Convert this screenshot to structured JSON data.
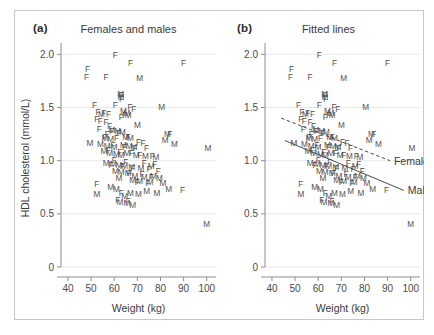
{
  "figure": {
    "panels": [
      {
        "letter": "(a)",
        "title": "Females and males"
      },
      {
        "letter": "(b)",
        "title": "Fitted lines"
      }
    ]
  },
  "chart_data": {
    "type": "scatter",
    "xlabel": "Weight (kg)",
    "ylabel": "HDL cholesterol (mmol/L)",
    "xlim": [
      37,
      104
    ],
    "ylim": [
      0,
      2.05
    ],
    "xticks": [
      40,
      50,
      60,
      70,
      80,
      90,
      100
    ],
    "xticklabels": [
      "40",
      "50",
      "60",
      "70",
      "80",
      "90",
      "100"
    ],
    "yticks": [
      0,
      0.5,
      1.0,
      1.5,
      2.0
    ],
    "yticklabels": [
      "0",
      "0.5",
      "1.0",
      "1.5",
      "2.0"
    ],
    "grid": "horizontal",
    "legend_position": "inline-line-labels",
    "marker_encoding": {
      "F": "female",
      "M": "male"
    },
    "series": [
      {
        "name": "Female",
        "marker": "F",
        "points": [
          [
            60.5,
            1.99
          ],
          [
            67.0,
            1.92
          ],
          [
            90.0,
            1.92
          ],
          [
            48.5,
            1.86
          ],
          [
            48.0,
            1.79
          ],
          [
            56.5,
            1.79
          ],
          [
            63.0,
            1.62
          ],
          [
            63.2,
            1.58
          ],
          [
            51.5,
            1.52
          ],
          [
            60.5,
            1.52
          ],
          [
            66.8,
            1.5
          ],
          [
            68.5,
            1.49
          ],
          [
            53.0,
            1.46
          ],
          [
            55.5,
            1.45
          ],
          [
            57.5,
            1.44
          ],
          [
            64.5,
            1.43
          ],
          [
            63.0,
            1.41
          ],
          [
            52.5,
            1.39
          ],
          [
            54.0,
            1.37
          ],
          [
            56.5,
            1.36
          ],
          [
            58.0,
            1.33
          ],
          [
            53.5,
            1.3
          ],
          [
            59.0,
            1.28
          ],
          [
            57.0,
            1.25
          ],
          [
            62.0,
            1.26
          ],
          [
            84.0,
            1.25
          ],
          [
            56.0,
            1.22
          ],
          [
            61.0,
            1.21
          ],
          [
            66.0,
            1.22
          ],
          [
            70.5,
            1.18
          ],
          [
            72.5,
            1.17
          ],
          [
            59.5,
            1.15
          ],
          [
            64.5,
            1.13
          ],
          [
            69.0,
            1.12
          ],
          [
            74.0,
            1.12
          ],
          [
            57.5,
            1.1
          ],
          [
            62.5,
            1.08
          ],
          [
            67.5,
            1.07
          ],
          [
            71.0,
            1.05
          ],
          [
            76.5,
            1.04
          ],
          [
            60.0,
            1.01
          ],
          [
            65.0,
            0.99
          ],
          [
            73.0,
            0.98
          ],
          [
            77.5,
            0.97
          ],
          [
            58.5,
            0.96
          ],
          [
            63.5,
            0.95
          ],
          [
            68.0,
            0.93
          ],
          [
            75.0,
            0.92
          ],
          [
            79.0,
            0.9
          ],
          [
            66.5,
            0.88
          ],
          [
            72.0,
            0.87
          ],
          [
            76.0,
            0.85
          ],
          [
            52.5,
            0.78
          ],
          [
            70.0,
            0.8
          ],
          [
            74.5,
            0.79
          ],
          [
            63.0,
            0.7
          ],
          [
            89.5,
            0.72
          ],
          [
            61.5,
            0.63
          ],
          [
            66.0,
            0.62
          ]
        ]
      },
      {
        "name": "Male",
        "marker": "M",
        "points": [
          [
            71.0,
            1.78
          ],
          [
            80.5,
            1.5
          ],
          [
            62.8,
            1.63
          ],
          [
            62.9,
            1.6
          ],
          [
            64.0,
            1.47
          ],
          [
            65.5,
            1.45
          ],
          [
            54.5,
            1.44
          ],
          [
            66.0,
            1.43
          ],
          [
            70.0,
            1.34
          ],
          [
            59.0,
            1.29
          ],
          [
            61.5,
            1.28
          ],
          [
            63.5,
            1.27
          ],
          [
            83.0,
            1.25
          ],
          [
            49.5,
            1.17
          ],
          [
            56.0,
            1.21
          ],
          [
            58.5,
            1.2
          ],
          [
            65.0,
            1.22
          ],
          [
            67.0,
            1.21
          ],
          [
            82.0,
            1.19
          ],
          [
            86.0,
            1.16
          ],
          [
            54.0,
            1.16
          ],
          [
            57.0,
            1.14
          ],
          [
            60.0,
            1.13
          ],
          [
            64.0,
            1.15
          ],
          [
            66.5,
            1.14
          ],
          [
            68.5,
            1.13
          ],
          [
            100.5,
            1.12
          ],
          [
            55.5,
            1.09
          ],
          [
            58.0,
            1.07
          ],
          [
            61.0,
            1.06
          ],
          [
            63.0,
            1.05
          ],
          [
            65.5,
            1.07
          ],
          [
            69.5,
            1.05
          ],
          [
            73.5,
            1.04
          ],
          [
            78.0,
            1.03
          ],
          [
            56.5,
            0.98
          ],
          [
            59.5,
            0.97
          ],
          [
            62.0,
            0.96
          ],
          [
            64.5,
            0.95
          ],
          [
            67.5,
            0.94
          ],
          [
            71.5,
            0.93
          ],
          [
            76.0,
            0.95
          ],
          [
            60.5,
            0.9
          ],
          [
            63.0,
            0.89
          ],
          [
            66.0,
            0.88
          ],
          [
            69.0,
            0.86
          ],
          [
            73.0,
            0.85
          ],
          [
            77.0,
            0.86
          ],
          [
            79.5,
            0.84
          ],
          [
            62.0,
            0.84
          ],
          [
            68.0,
            0.82
          ],
          [
            71.0,
            0.81
          ],
          [
            75.5,
            0.8
          ],
          [
            81.0,
            0.79
          ],
          [
            58.5,
            0.75
          ],
          [
            61.0,
            0.73
          ],
          [
            67.0,
            0.7
          ],
          [
            70.5,
            0.69
          ],
          [
            74.0,
            0.71
          ],
          [
            78.5,
            0.7
          ],
          [
            83.5,
            0.73
          ],
          [
            52.5,
            0.69
          ],
          [
            64.5,
            0.67
          ],
          [
            62.5,
            0.61
          ],
          [
            65.5,
            0.6
          ],
          [
            68.0,
            0.58
          ],
          [
            100.0,
            0.4
          ]
        ]
      }
    ],
    "fitted_lines": [
      {
        "name": "Female",
        "style": "dashed",
        "label": "Female",
        "x_start": 44.0,
        "y_start": 1.4,
        "x_end": 91.0,
        "y_end": 1.0
      },
      {
        "name": "Male",
        "style": "solid",
        "label": "Male",
        "x_start": 45.5,
        "y_start": 1.19,
        "x_end": 97.0,
        "y_end": 0.72
      }
    ]
  }
}
